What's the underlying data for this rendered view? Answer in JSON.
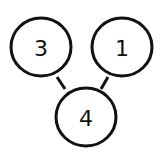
{
  "diagram": {
    "type": "tree",
    "nodes": [
      {
        "id": "n3",
        "label": "3",
        "cx": 41,
        "cy": 47,
        "rx": 30,
        "ry": 29
      },
      {
        "id": "n1",
        "label": "1",
        "cx": 122,
        "cy": 47,
        "rx": 30,
        "ry": 29
      },
      {
        "id": "n4",
        "label": "4",
        "cx": 86,
        "cy": 117,
        "rx": 30,
        "ry": 29
      }
    ],
    "edges": [
      {
        "from": "n3",
        "to": "n4",
        "x1": 57,
        "y1": 77,
        "x2": 65,
        "y2": 89
      },
      {
        "from": "n1",
        "to": "n4",
        "x1": 108,
        "y1": 77,
        "x2": 101,
        "y2": 89
      }
    ],
    "colors": {
      "stroke": "#111111",
      "fill": "#ffffff",
      "background": "#ffffff"
    }
  }
}
